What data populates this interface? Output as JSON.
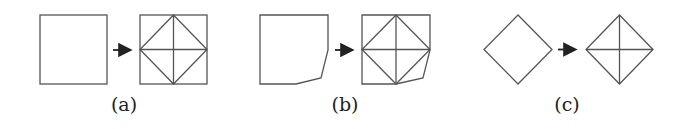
{
  "figure": {
    "panels": [
      {
        "label": "(a)",
        "description": "Square subdivided into diamond with cross lines",
        "input_shape": "square",
        "output_shape": "square with inscribed diamond and midlines"
      },
      {
        "label": "(b)",
        "description": "Square with cut bottom-right corner subdivided similarly",
        "input_shape": "pentagon (square with clipped corner)",
        "output_shape": "clipped square with inscribed diamond and midlines"
      },
      {
        "label": "(c)",
        "description": "Diamond subdivided by its diagonals",
        "input_shape": "diamond",
        "output_shape": "diamond with diagonals"
      }
    ],
    "arrow_icon": "right-arrow-icon",
    "colors": {
      "stroke": "#555555",
      "arrow": "#222222",
      "text": "#222222"
    }
  }
}
